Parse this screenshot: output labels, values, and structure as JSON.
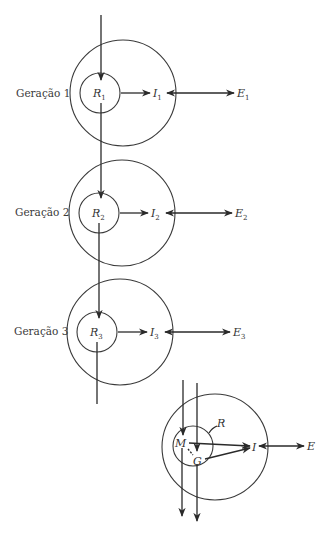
{
  "diagram": {
    "generations": [
      {
        "label": "Geração 1",
        "r": "R",
        "r_sub": "1",
        "i": "I",
        "i_sub": "1",
        "e": "E",
        "e_sub": "1"
      },
      {
        "label": "Geração 2",
        "r": "R",
        "r_sub": "2",
        "i": "I",
        "i_sub": "2",
        "e": "E",
        "e_sub": "2"
      },
      {
        "label": "Geração 3",
        "r": "R",
        "r_sub": "3",
        "i": "I",
        "i_sub": "3",
        "e": "E",
        "e_sub": "3"
      }
    ],
    "combined": {
      "m": "M",
      "g": "G",
      "r": "R",
      "i": "I",
      "e": "E"
    },
    "colors": {
      "stroke": "#2a2a2a",
      "background": "#ffffff"
    }
  }
}
